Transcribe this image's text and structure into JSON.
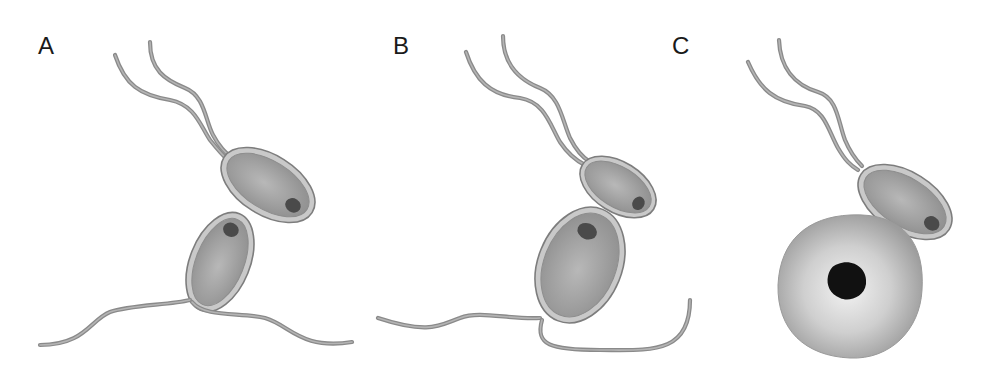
{
  "figure": {
    "panels": [
      {
        "id": "A",
        "label": "A",
        "description": "Two biflagellate cells contacting at their ends"
      },
      {
        "id": "B",
        "label": "B",
        "description": "Smaller cell attached to larger biflagellate cell"
      },
      {
        "id": "C",
        "label": "C",
        "description": "Biflagellate cell attached to large round non-flagellated cell with dark nucleus"
      }
    ],
    "colors": {
      "background": "#ffffff",
      "cell_wall": "#c9c9c9",
      "cell_outline": "#7d7d7d",
      "cell_body_center": "#b5b5b5",
      "cell_body_edge": "#8f8f8f",
      "flagellum": "#8a8a8a",
      "spot": "#4a4a4a",
      "nucleus": "#111111"
    }
  }
}
